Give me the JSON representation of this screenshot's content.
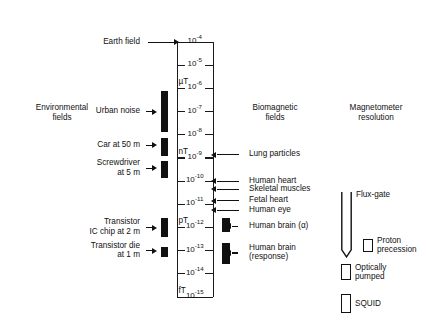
{
  "figure": {
    "axis_title": "B",
    "axis": {
      "decades": [
        "10⁻⁴",
        "10⁻⁵",
        "10⁻⁶",
        "10⁻⁷",
        "10⁻⁸",
        "10⁻⁹",
        "10⁻¹⁰",
        "10⁻¹¹",
        "10⁻¹²",
        "10⁻¹³",
        "10⁻¹⁴",
        "10⁻¹⁵"
      ],
      "exponents": [
        -4,
        -5,
        -6,
        -7,
        -8,
        -9,
        -10,
        -11,
        -12,
        -13,
        -14,
        -15
      ],
      "mantissa": "10",
      "unit_markers": [
        {
          "label": "µT",
          "exponent": -6
        },
        {
          "label": "nT",
          "exponent": -9
        },
        {
          "label": "pT",
          "exponent": -12
        },
        {
          "label": "fT",
          "exponent": -15
        }
      ]
    },
    "columns": {
      "environmental": {
        "header_line1": "Environmental",
        "header_line2": "fields"
      },
      "biomagnetic": {
        "header_line1": "Biomagnetic",
        "header_line2": "fields"
      },
      "magnetometer": {
        "header_line1": "Magnetometer",
        "header_line2": "resolution"
      }
    },
    "environmental_sources": [
      {
        "label_line1": "Earth field",
        "label_line2": "",
        "exponent": -4.0,
        "has_bar": false,
        "bar_top_exp": null,
        "bar_bottom_exp": null
      },
      {
        "label_line1": "Urban noise",
        "label_line2": "",
        "exponent": -7.0,
        "has_bar": true,
        "bar_top_exp": -6.15,
        "bar_bottom_exp": -7.9
      },
      {
        "label_line1": "Car at 50 m",
        "label_line2": "",
        "exponent": -8.45,
        "has_bar": true,
        "bar_top_exp": -8.15,
        "bar_bottom_exp": -8.95
      },
      {
        "label_line1": "Screwdriver",
        "label_line2": "at 5 m",
        "exponent": -9.45,
        "has_bar": true,
        "bar_top_exp": -9.15,
        "bar_bottom_exp": -9.9
      },
      {
        "label_line1": "Transistor",
        "label_line2": "IC chip at 2 m",
        "exponent": -12.0,
        "has_bar": true,
        "bar_top_exp": -11.6,
        "bar_bottom_exp": -12.45
      },
      {
        "label_line1": "Transistor die",
        "label_line2": "at 1 m",
        "exponent": -13.0,
        "has_bar": true,
        "bar_top_exp": -12.85,
        "bar_bottom_exp": -13.3
      }
    ],
    "biomagnetic_sources": [
      {
        "label_line1": "Lung particles",
        "label_line2": "",
        "exponent": -8.85,
        "has_bar": false,
        "bar_top_exp": null,
        "bar_bottom_exp": null
      },
      {
        "label_line1": "Human heart",
        "label_line2": "",
        "exponent": -10.0,
        "has_bar": false,
        "bar_top_exp": null,
        "bar_bottom_exp": null
      },
      {
        "label_line1": "Skeletal muscles",
        "label_line2": "",
        "exponent": -10.35,
        "has_bar": false,
        "bar_top_exp": null,
        "bar_bottom_exp": null
      },
      {
        "label_line1": "Fetal heart",
        "label_line2": "",
        "exponent": -10.85,
        "has_bar": false,
        "bar_top_exp": null,
        "bar_bottom_exp": null
      },
      {
        "label_line1": "Human eye",
        "label_line2": "",
        "exponent": -11.25,
        "has_bar": false,
        "bar_top_exp": null,
        "bar_bottom_exp": null
      },
      {
        "label_line1": "Human brain (α)",
        "label_line2": "",
        "exponent": -11.95,
        "has_bar": true,
        "bar_top_exp": -11.6,
        "bar_bottom_exp": -12.2
      },
      {
        "label_line1": "Human brain",
        "label_line2": "(response)",
        "exponent": -13.1,
        "has_bar": true,
        "bar_top_exp": -12.7,
        "bar_bottom_exp": -13.6
      }
    ],
    "magnetometers": [
      {
        "label_line1": "Flux-gate",
        "label_line2": "",
        "shape": "fluxgate",
        "top_exp": -10.5,
        "bottom_exp": -13.3
      },
      {
        "label_line1": "Proton",
        "label_line2": "precession",
        "shape": "box",
        "top_exp": -12.5,
        "bottom_exp": -13.1
      },
      {
        "label_line1": "Optically",
        "label_line2": "pumped",
        "shape": "box",
        "top_exp": -13.6,
        "bottom_exp": -14.3
      },
      {
        "label_line1": "SQUID",
        "label_line2": "",
        "shape": "box",
        "top_exp": -14.9,
        "bottom_exp": -15.7
      }
    ],
    "colors": {
      "ink": "#111111",
      "background": "#ffffff"
    }
  }
}
